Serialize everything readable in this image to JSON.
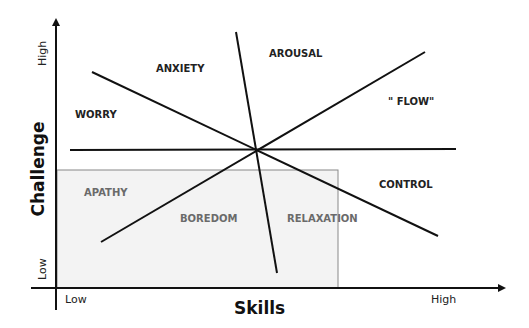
{
  "diagram": {
    "type": "flow-model-quadrants",
    "axes": {
      "x": {
        "title": "Skills",
        "low_label": "Low",
        "high_label": "High"
      },
      "y": {
        "title": "Challenge",
        "low_label": "Low",
        "high_label": "High"
      }
    },
    "regions": [
      {
        "id": "anxiety",
        "label": "ANXIETY"
      },
      {
        "id": "arousal",
        "label": "AROUSAL"
      },
      {
        "id": "worry",
        "label": "WORRY"
      },
      {
        "id": "flow",
        "label": "\" FLOW\""
      },
      {
        "id": "apathy",
        "label": "APATHY"
      },
      {
        "id": "boredom",
        "label": "BOREDOM"
      },
      {
        "id": "relaxation",
        "label": "RELAXATION"
      },
      {
        "id": "control",
        "label": "CONTROL"
      }
    ],
    "colors": {
      "line": "#111111",
      "shaded_region": "#f3f3f3",
      "shaded_border": "#888888",
      "shaded_text": "#6a6a6a"
    }
  }
}
